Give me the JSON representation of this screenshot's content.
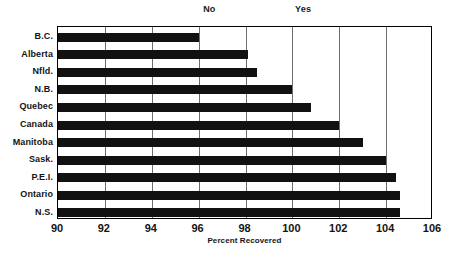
{
  "chart_data": {
    "type": "bar",
    "orientation": "horizontal",
    "title": "",
    "xlabel": "Percent Recovered",
    "ylabel": "",
    "xlim": [
      90,
      106
    ],
    "xticks": [
      90,
      92,
      94,
      96,
      98,
      100,
      102,
      104,
      106
    ],
    "xtick_labels": [
      "90",
      "92",
      "94",
      "96",
      "98",
      "100",
      "102",
      "104",
      "106"
    ],
    "grid": true,
    "grid_axis": "x",
    "legend": false,
    "bar_color": "#111111",
    "categories": [
      "B.C.",
      "Alberta",
      "Nfld.",
      "N.B.",
      "Quebec",
      "Canada",
      "Manitoba",
      "Sask.",
      "P.E.I.",
      "Ontario",
      "N.S."
    ],
    "values": [
      96.0,
      98.1,
      98.5,
      100.0,
      100.8,
      102.0,
      103.0,
      104.0,
      104.4,
      104.6,
      104.6
    ],
    "annotations": [
      {
        "text": "No",
        "x": 96.5
      },
      {
        "text": "Yes",
        "x": 100.5
      }
    ]
  }
}
